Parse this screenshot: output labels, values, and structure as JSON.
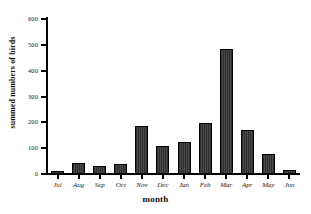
{
  "chart_data": {
    "type": "bar",
    "title": "",
    "xlabel": "month",
    "ylabel": "summed numbers of birds",
    "categories": [
      "Jul",
      "Aug",
      "Sep",
      "Oct",
      "Nov",
      "Dec",
      "Jan",
      "Feb",
      "Mar",
      "Apr",
      "May",
      "Jun"
    ],
    "values": [
      12,
      42,
      30,
      40,
      185,
      108,
      123,
      196,
      485,
      170,
      76,
      15
    ],
    "series": [
      {
        "name": "summed numbers of birds",
        "values": [
          12,
          42,
          30,
          40,
          185,
          108,
          123,
          196,
          485,
          170,
          76,
          15
        ]
      }
    ],
    "ylim": [
      0,
      600
    ],
    "ytick_labels": [
      "0",
      "100",
      "200",
      "300",
      "400",
      "500",
      "600"
    ],
    "ytick_values": [
      0,
      100,
      200,
      300,
      400,
      500,
      600
    ],
    "grid": false,
    "legend": null,
    "legend_position": "none",
    "bar_color": "#3a3a3a",
    "bar_edge_color": "#000000",
    "background_color": "#ffffff"
  },
  "axes": {
    "y_title": "summed numbers of birds",
    "x_title": "month"
  }
}
